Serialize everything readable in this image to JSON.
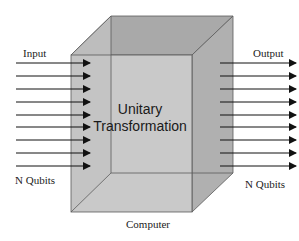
{
  "diagram": {
    "box_label_line1": "Unitary",
    "box_label_line2": "Transformation",
    "input_label": "Input",
    "output_label": "Output",
    "input_qubits_label": "N Qubits",
    "output_qubits_label": "N Qubits",
    "box_caption": "Computer",
    "arrow_count": 9,
    "colors": {
      "front_face": "#c2c2c2",
      "side_face": "#b2b2b2",
      "top_face": "#a9a9a9",
      "edge": "#5a5a5a",
      "arrow": "#111111"
    }
  }
}
